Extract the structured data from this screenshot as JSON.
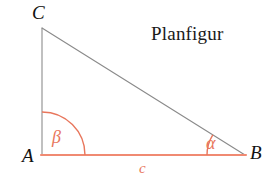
{
  "figure": {
    "caption": "Planfigur",
    "background_color": "#ffffff",
    "stroke_colors": {
      "leg_gray": "#8c8c8c",
      "hypotenuse_gray": "#8a8a8a",
      "base_orange": "#f08a72",
      "arc_orange": "#e8765c"
    },
    "vertices": [
      {
        "name": "C",
        "label": "C",
        "x": 42,
        "y": 28
      },
      {
        "name": "A",
        "label": "A",
        "x": 42,
        "y": 155
      },
      {
        "name": "B",
        "label": "B",
        "x": 245,
        "y": 155
      }
    ],
    "sides": [
      {
        "name": "side-ac",
        "label": "",
        "from": "A",
        "to": "C",
        "color": "#8c8c8c",
        "width": 1
      },
      {
        "name": "side-cb",
        "label": "",
        "from": "C",
        "to": "B",
        "color": "#8a8a8a",
        "width": 1
      },
      {
        "name": "side-ab",
        "label": "c",
        "from": "A",
        "to": "B",
        "color": "#f08a72",
        "width": 2
      }
    ],
    "angles": [
      {
        "name": "angle-beta",
        "label": "β",
        "at_vertex": "A",
        "radius": 43,
        "start_deg": 0,
        "end_deg": 90,
        "color": "#e8765c"
      },
      {
        "name": "angle-alpha",
        "label": "α",
        "at_vertex": "B",
        "radius": 38,
        "start_deg": 148,
        "end_deg": 180,
        "color": "#e8765c"
      }
    ],
    "labels": {
      "vertex_c": "C",
      "vertex_a": "A",
      "vertex_b": "B",
      "angle_beta": "β",
      "angle_alpha": "α",
      "side_c": "c",
      "caption": "Planfigur"
    }
  }
}
